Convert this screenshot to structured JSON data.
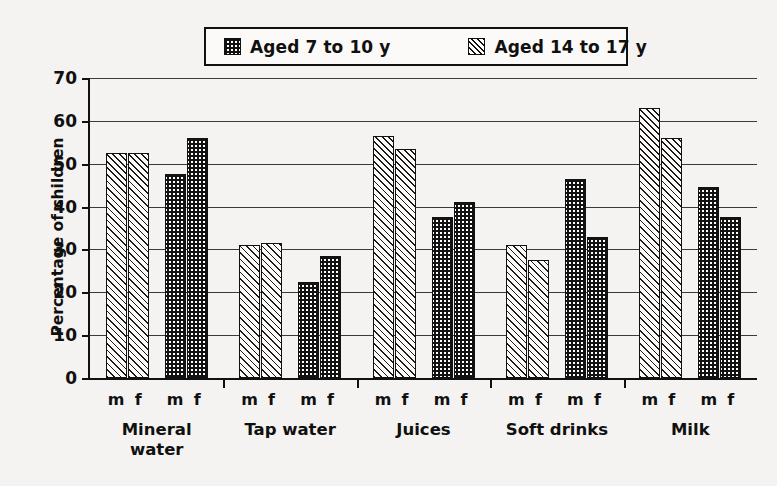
{
  "chart_data": {
    "type": "bar",
    "title": "",
    "xlabel": "",
    "ylabel": "Percentage of children",
    "ylim": [
      0,
      70
    ],
    "yticks": [
      0,
      10,
      20,
      30,
      40,
      50,
      60,
      70
    ],
    "grid": true,
    "legend_position": "top-center",
    "categories": [
      "Mineral water",
      "Tap water",
      "Juices",
      "Soft drinks",
      "Milk"
    ],
    "subgroups": [
      "m",
      "f"
    ],
    "series": [
      {
        "name": "Aged 14 to 17 y",
        "pattern": "diagonal-hatch",
        "values": {
          "m": [
            52.5,
            31.0,
            56.5,
            31.0,
            63.0
          ],
          "f": [
            52.5,
            31.5,
            53.5,
            27.5,
            56.0
          ]
        }
      },
      {
        "name": "Aged 7 to 10 y",
        "pattern": "dotted",
        "values": {
          "m": [
            47.5,
            22.5,
            37.5,
            46.5,
            44.5
          ],
          "f": [
            56.0,
            28.5,
            41.0,
            33.0,
            37.5
          ]
        }
      }
    ]
  },
  "legend": {
    "items": [
      {
        "label": "Aged 7 to 10 y",
        "swatch": "dotted"
      },
      {
        "label": "Aged 14 to 17 y",
        "swatch": "hatch"
      }
    ]
  },
  "axes": {
    "y_title": "Percentage of children",
    "y_tick_labels": [
      "70",
      "60",
      "50",
      "40",
      "30",
      "20",
      "10",
      "0"
    ],
    "subgroup_labels": [
      "m",
      "f",
      "m",
      "f"
    ],
    "category_labels": [
      "Mineral water",
      "Tap water",
      "Juices",
      "Soft drinks",
      "Milk"
    ]
  },
  "colors": {
    "background": "#f4f3f1",
    "ink": "#111111",
    "gridline": "#3a3a3a",
    "bar_fill_dark": "#121212",
    "bar_fill_light": "#fcfbf9"
  }
}
